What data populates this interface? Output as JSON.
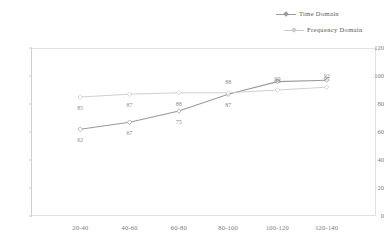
{
  "chart_data": {
    "type": "line",
    "title": "",
    "xlabel": "",
    "ylabel": "",
    "categories": [
      "20-40",
      "40-60",
      "60-80",
      "80-100",
      "100-120",
      "120-140"
    ],
    "series": [
      {
        "name": "Time Domain",
        "color": "#9a9a9a",
        "marker": "diamond",
        "values": [
          62,
          67,
          75,
          87,
          96,
          97
        ]
      },
      {
        "name": "Frequency Domain",
        "color": "#c9c9c9",
        "marker": "diamond",
        "values": [
          85,
          87,
          88,
          88,
          90,
          92
        ]
      }
    ],
    "ylim": [
      0,
      120
    ],
    "yticks": [
      0,
      20,
      40,
      60,
      80,
      100,
      120
    ],
    "ytick_labels": [
      "0",
      "20",
      "40",
      "60",
      "80",
      "100",
      "120"
    ],
    "grid": false,
    "legend_position": "top-right",
    "data_labels": true
  },
  "legend": {
    "items": [
      {
        "label": "Time Domain",
        "color": "#9a9a9a"
      },
      {
        "label": "Frequency Domain",
        "color": "#c9c9c9"
      }
    ]
  },
  "colors": {
    "time_domain": "#9a9a9a",
    "frequency_domain": "#c9c9c9",
    "axis": "#cfcfcf",
    "frame": "#e2e2e2",
    "text": "#7a7a7a",
    "background": "#ffffff"
  }
}
